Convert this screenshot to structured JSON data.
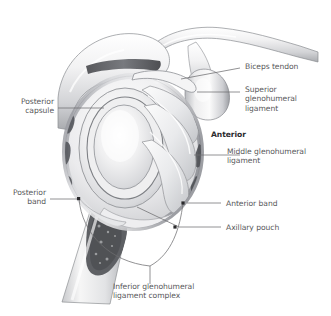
{
  "figure": {
    "background_color": "#ffffff",
    "label_color": "#58585a",
    "emphasis_color": "#2b2b2d",
    "leader_color": "#6e6e70"
  },
  "labels": {
    "biceps_tendon": "Biceps tendon",
    "superior_glenohumeral_ligament": "Superior\nglenohumeral\nligament",
    "anterior": "Anterior",
    "middle_glenohumeral_ligament": "Middle glenohumeral\nligament",
    "posterior_capsule": "Posterior\ncapsule",
    "posterior_band": "Posterior\nband",
    "anterior_band": "Anterior band",
    "axillary_pouch": "Axillary pouch",
    "inferior_glenohumeral_ligament_complex": "Inferior glenohumeral\nligament complex"
  },
  "anatomy": {
    "structures": [
      "clavicle",
      "acromion",
      "coracoid process",
      "humeral head",
      "humeral shaft",
      "glenoid fossa",
      "glenoid labrum",
      "joint capsule",
      "biceps tendon",
      "superior glenohumeral ligament",
      "middle glenohumeral ligament",
      "inferior glenohumeral ligament complex",
      "anterior band",
      "posterior band",
      "axillary pouch"
    ],
    "view": "lateral view of glenoid with humerus reflected",
    "style": "grayscale medical illustration"
  }
}
